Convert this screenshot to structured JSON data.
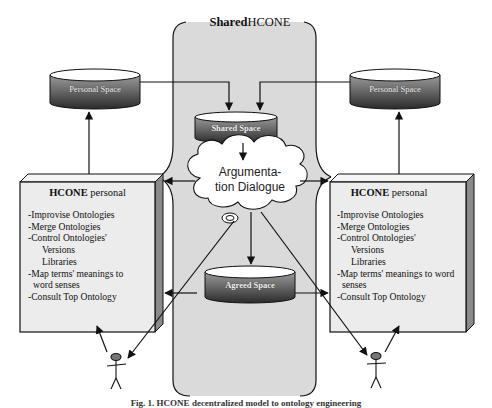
{
  "figure": {
    "caption": "Fig. 1. HCONE decentralized model to ontology engineering"
  },
  "shared_region": {
    "title_bold": "Shared",
    "title_rest": "HCONE"
  },
  "databases": {
    "personal_left": "Personal Space",
    "personal_right": "Personal Space",
    "shared": "Shared Space",
    "agreed": "Agreed Space"
  },
  "cloud": {
    "line1": "Argumenta-",
    "line2": "tion Dialogue"
  },
  "hcone_left": {
    "title_bold": "HCONE",
    "title_rest": " personal",
    "items": [
      {
        "text": "-Improvise Ontologies",
        "kind": "item"
      },
      {
        "text": "-Merge Ontologies",
        "kind": "item"
      },
      {
        "text": "-Control Ontologies'",
        "kind": "item"
      },
      {
        "text": "Versions",
        "kind": "sub"
      },
      {
        "text": "Libraries",
        "kind": "sub"
      },
      {
        "text": "-Map terms' meanings to",
        "kind": "item"
      },
      {
        "text": "word senses",
        "kind": "cont"
      },
      {
        "text": "-Consult Top Ontology",
        "kind": "item"
      }
    ]
  },
  "hcone_right": {
    "title_bold": "HCONE",
    "title_rest": " personal",
    "items": [
      {
        "text": "-Improvise Ontologies",
        "kind": "item"
      },
      {
        "text": "-Merge Ontologies",
        "kind": "item"
      },
      {
        "text": "-Control Ontologies'",
        "kind": "item"
      },
      {
        "text": "Versions",
        "kind": "sub"
      },
      {
        "text": "Libraries",
        "kind": "sub"
      },
      {
        "text": "-Map terms' meanings to word",
        "kind": "item"
      },
      {
        "text": "senses",
        "kind": "cont"
      },
      {
        "text": "-Consult Top Ontology",
        "kind": "item"
      }
    ]
  },
  "actors": {
    "left": "user-left",
    "right": "user-right"
  },
  "colors": {
    "shared_bg": "#d9d9d9",
    "box_bg": "#ededed",
    "db_top": "#555555",
    "db_bottom": "#222222",
    "line": "#111111"
  }
}
